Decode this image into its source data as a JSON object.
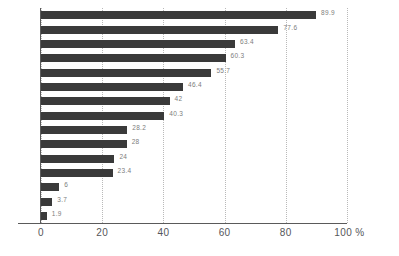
{
  "chart_data": {
    "type": "bar",
    "orientation": "horizontal",
    "title": "",
    "subtitle": "",
    "xlabel": "",
    "ylabel": "",
    "xlim": [
      0,
      100
    ],
    "xticks": [
      "0",
      "20",
      "40",
      "60",
      "80",
      "100 %"
    ],
    "xtick_values": [
      0,
      20,
      40,
      60,
      80,
      100
    ],
    "grid": "vertical-dotted",
    "legend": "none",
    "bar_color": "#3a3a3a",
    "label_color": "#7d7d7d",
    "axis_color": "#5a5a5a",
    "gridline_color": "#b9b9b9",
    "categories": [
      "",
      "",
      "",
      "",
      "",
      "",
      "",
      "",
      "",
      "",
      "",
      "",
      "",
      "",
      ""
    ],
    "values": [
      89.9,
      77.6,
      63.4,
      60.3,
      55.7,
      46.4,
      42,
      40.3,
      28.2,
      28,
      24,
      23.4,
      6,
      3.7,
      1.9
    ],
    "data_labels": [
      "89.9",
      "77.6",
      "63.4",
      "60.3",
      "55.7",
      "46.4",
      "42",
      "40.3",
      "28.2",
      "28",
      "24",
      "23.4",
      "6",
      "3.7",
      "1.9"
    ]
  }
}
